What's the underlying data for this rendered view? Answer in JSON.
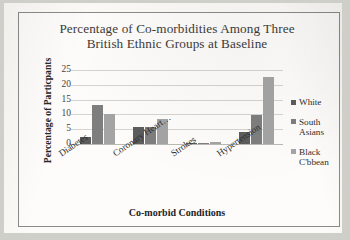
{
  "chart_data": {
    "type": "bar",
    "title": "Percentage of Co-morbidities Among Three British Ethnic Groups at Baseline",
    "title_line1": "Percentage of Co-morbidities Among Three",
    "title_line2": "British Ethnic Groups at Baseline",
    "xlabel": "Co-morbid Conditions",
    "ylabel": "Percentage of Particpants",
    "categories": [
      "Diabetes",
      "Coronary Heart…",
      "Strokes",
      "Hypertension"
    ],
    "series": [
      {
        "name": "White",
        "color": "#5d5d5d",
        "values": [
          2.3,
          5.8,
          0.1,
          3.9
        ]
      },
      {
        "name": "South Asians",
        "color": "#7e7e7e",
        "values": [
          13.3,
          5.7,
          0.1,
          9.7
        ]
      },
      {
        "name": "Black C'bbean",
        "color": "#a4a4a4",
        "values": [
          10.3,
          8.6,
          0.6,
          22.5
        ]
      }
    ],
    "ylim": [
      0,
      25
    ],
    "yticks": [
      0,
      5,
      10,
      15,
      20,
      25
    ],
    "ytick_labels": [
      "0",
      "5",
      "10",
      "15",
      "20",
      "25"
    ],
    "grid": true,
    "legend_position": "right",
    "legend_entries": [
      "White",
      "South Asians",
      "Black C'bbean"
    ],
    "legend_lines": [
      [
        "White"
      ],
      [
        "South",
        "Asians"
      ],
      [
        "Black",
        "C'bbean"
      ]
    ]
  }
}
